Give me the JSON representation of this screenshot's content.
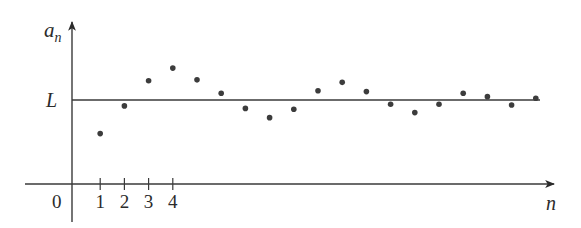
{
  "chart_data": {
    "type": "scatter",
    "title": "",
    "xlabel": "n",
    "ylabel": "a_n",
    "ylabel_main": "a",
    "ylabel_sub": "n",
    "origin_label": "0",
    "x_tick_labels": [
      "1",
      "2",
      "3",
      "4"
    ],
    "limit_label": "L",
    "limit_value": 1.0,
    "grid": false,
    "legend": null,
    "xlim": [
      0,
      20
    ],
    "ylim": [
      0,
      1.7
    ],
    "x": [
      1,
      2,
      3,
      4,
      5,
      6,
      7,
      8,
      9,
      10,
      11,
      12,
      13,
      14,
      15,
      16,
      17,
      18,
      19
    ],
    "values": [
      0.6,
      0.93,
      1.23,
      1.38,
      1.24,
      1.08,
      0.9,
      0.79,
      0.89,
      1.11,
      1.21,
      1.1,
      0.95,
      0.85,
      0.95,
      1.08,
      1.04,
      0.94,
      1.02
    ],
    "annotations": [
      "Horizontal line y = L: sequence a_n oscillates and converges to limit L"
    ]
  },
  "colors": {
    "axis": "#3a3a3a",
    "point": "#3c3c3c",
    "text": "#2b2b2b",
    "background": "#ffffff"
  }
}
